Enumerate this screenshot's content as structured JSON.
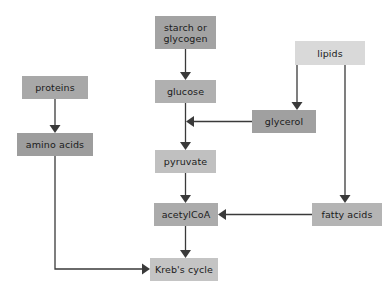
{
  "diagram": {
    "type": "flowchart",
    "canvas": {
      "width": 391,
      "height": 298,
      "background": "#ffffff"
    },
    "colors": {
      "box_dark": "#a3a3a3",
      "box_medium": "#ababab",
      "box_light": "#c4c4c4",
      "box_lighter": "#d9d9d9",
      "arrow": "#3a3a3a",
      "text": "#1b1b1b"
    },
    "nodes": [
      {
        "id": "starch_or_glycogen",
        "label": "starch or\nglycogen",
        "x": 155,
        "y": 16,
        "w": 61,
        "h": 33,
        "fill": "#a3a3a3"
      },
      {
        "id": "lipids",
        "label": "lipids",
        "x": 295,
        "y": 41,
        "w": 70,
        "h": 24,
        "fill": "#d9d9d9"
      },
      {
        "id": "proteins",
        "label": "proteins",
        "x": 22,
        "y": 76,
        "w": 66,
        "h": 23,
        "fill": "#a8a8a8"
      },
      {
        "id": "glucose",
        "label": "glucose",
        "x": 155,
        "y": 80,
        "w": 61,
        "h": 23,
        "fill": "#b0b0b0"
      },
      {
        "id": "glycerol",
        "label": "glycerol",
        "x": 252,
        "y": 110,
        "w": 64,
        "h": 23,
        "fill": "#a0a0a0"
      },
      {
        "id": "amino_acids",
        "label": "amino acids",
        "x": 17,
        "y": 133,
        "w": 76,
        "h": 23,
        "fill": "#9d9d9d"
      },
      {
        "id": "pyruvate",
        "label": "pyruvate",
        "x": 155,
        "y": 150,
        "w": 61,
        "h": 23,
        "fill": "#c0c0c0"
      },
      {
        "id": "acetylcoa",
        "label": "acetylCoA",
        "x": 154,
        "y": 203,
        "w": 64,
        "h": 23,
        "fill": "#ababab"
      },
      {
        "id": "fatty_acids",
        "label": "fatty acids",
        "x": 312,
        "y": 203,
        "w": 70,
        "h": 23,
        "fill": "#b4b4b4"
      },
      {
        "id": "krebs_cycle",
        "label": "Kreb's cycle",
        "x": 150,
        "y": 258,
        "w": 68,
        "h": 23,
        "fill": "#c4c4c4"
      }
    ],
    "edges": [
      {
        "id": "starch-to-glucose",
        "from": "starch_or_glycogen",
        "to": "glucose",
        "path": "M185.5,49 L185.5,74",
        "arrow_at": [
          185.5,
          80
        ],
        "arrow_dir": "down"
      },
      {
        "id": "glucose-to-pyruvate",
        "from": "glucose",
        "to": "pyruvate",
        "path": "M185.5,103 L185.5,144",
        "arrow_at": [
          185.5,
          150
        ],
        "arrow_dir": "down"
      },
      {
        "id": "pyruvate-to-acetylcoa",
        "from": "pyruvate",
        "to": "acetylcoa",
        "path": "M185.5,173 L185.5,197",
        "arrow_at": [
          185.5,
          203
        ],
        "arrow_dir": "down"
      },
      {
        "id": "acetylcoa-to-krebs",
        "from": "acetylcoa",
        "to": "krebs_cycle",
        "path": "M185.5,226 L185.5,252",
        "arrow_at": [
          185.5,
          258
        ],
        "arrow_dir": "down"
      },
      {
        "id": "proteins-to-amino-acids",
        "from": "proteins",
        "to": "amino_acids",
        "path": "M55,99 L55,127",
        "arrow_at": [
          55,
          133
        ],
        "arrow_dir": "down"
      },
      {
        "id": "amino-acids-to-krebs",
        "from": "amino_acids",
        "to": "krebs_cycle",
        "path": "M55,156 L55,269 L144,269",
        "arrow_at": [
          150,
          269
        ],
        "arrow_dir": "right"
      },
      {
        "id": "lipids-to-glycerol",
        "from": "lipids",
        "to": "glycerol",
        "path": "M297,65 L297,104",
        "arrow_at": [
          297,
          110
        ],
        "arrow_dir": "down"
      },
      {
        "id": "lipids-to-fatty-acids",
        "from": "lipids",
        "to": "fatty_acids",
        "path": "M345,65 L345,197",
        "arrow_at": [
          345,
          203
        ],
        "arrow_dir": "down"
      },
      {
        "id": "glycerol-to-glucose-pyruvate",
        "from": "glycerol",
        "to": "glucose_pyruvate_link",
        "path": "M252,121.5 L192,121.5",
        "arrow_at": [
          186,
          121.5
        ],
        "arrow_dir": "left"
      },
      {
        "id": "fatty-acids-to-acetylcoa",
        "from": "fatty_acids",
        "to": "acetylcoa",
        "path": "M312,214.5 L224,214.5",
        "arrow_at": [
          218,
          214.5
        ],
        "arrow_dir": "left"
      }
    ]
  }
}
